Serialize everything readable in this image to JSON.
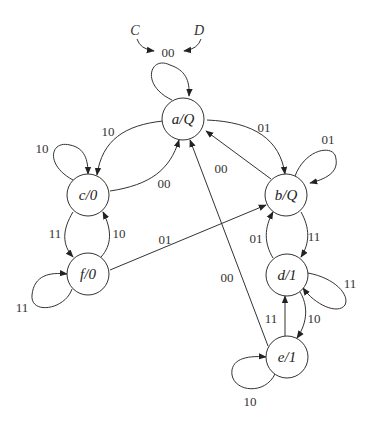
{
  "diagram": {
    "type": "state-transition (Moore machine)",
    "start": {
      "inputs": [
        "C",
        "D"
      ],
      "label": "00"
    },
    "nodes": [
      {
        "id": "a",
        "label": "a/Q",
        "name": "a",
        "output": "Q"
      },
      {
        "id": "b",
        "label": "b/Q",
        "name": "b",
        "output": "Q"
      },
      {
        "id": "c",
        "label": "c/0",
        "name": "c",
        "output": "0"
      },
      {
        "id": "d",
        "label": "d/1",
        "name": "d",
        "output": "1"
      },
      {
        "id": "e",
        "label": "e/1",
        "name": "e",
        "output": "1"
      },
      {
        "id": "f",
        "label": "f/0",
        "name": "f",
        "output": "0"
      }
    ],
    "edges": [
      {
        "from": "a",
        "to": "a",
        "label": "00"
      },
      {
        "from": "a",
        "to": "c",
        "label": "10"
      },
      {
        "from": "a",
        "to": "b",
        "label": "01"
      },
      {
        "from": "c",
        "to": "c",
        "label": "10"
      },
      {
        "from": "c",
        "to": "a",
        "label": "00"
      },
      {
        "from": "b",
        "to": "b",
        "label": "01"
      },
      {
        "from": "b",
        "to": "a",
        "label": "00"
      },
      {
        "from": "c",
        "to": "f",
        "label": "11"
      },
      {
        "from": "f",
        "to": "c",
        "label": "10"
      },
      {
        "from": "f",
        "to": "f",
        "label": "11"
      },
      {
        "from": "f",
        "to": "b",
        "label": "01"
      },
      {
        "from": "b",
        "to": "d",
        "label": "11"
      },
      {
        "from": "d",
        "to": "b",
        "label": "01"
      },
      {
        "from": "d",
        "to": "d",
        "label": "11"
      },
      {
        "from": "d",
        "to": "e",
        "label": "10"
      },
      {
        "from": "e",
        "to": "d",
        "label": "11"
      },
      {
        "from": "e",
        "to": "e",
        "label": "10"
      },
      {
        "from": "e",
        "to": "a",
        "label": "00"
      }
    ]
  }
}
